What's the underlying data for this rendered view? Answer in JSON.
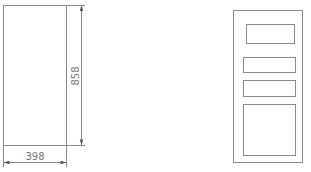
{
  "diagram": {
    "type": "technical-drawing",
    "line_color": "#8a8a8a",
    "left_view": {
      "name": "panel-outline",
      "dimensions": {
        "width_label": "398",
        "height_label": "858"
      }
    },
    "right_view": {
      "name": "panel-front-layout",
      "inner_panels": [
        {
          "name": "top-panel"
        },
        {
          "name": "middle-panel-1"
        },
        {
          "name": "middle-panel-2"
        },
        {
          "name": "bottom-panel"
        }
      ]
    }
  }
}
